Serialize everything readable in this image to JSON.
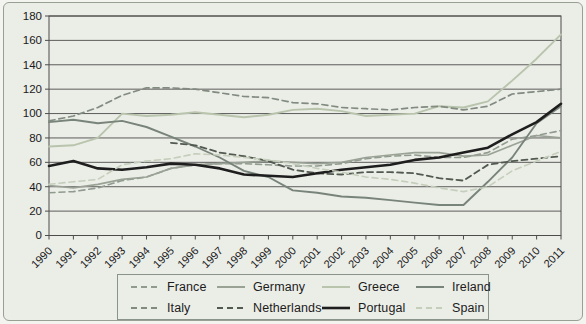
{
  "figure": {
    "background": "#ebede7",
    "outer_border_color": "#98a094",
    "grid_color": "#4d4d4d",
    "axis_color": "#4d4d4d",
    "tick_label_color": "#1a1a1a"
  },
  "chart_data": {
    "type": "line",
    "title": "",
    "xlabel": "",
    "ylabel": "",
    "x": [
      1990,
      1991,
      1992,
      1993,
      1994,
      1995,
      1996,
      1997,
      1998,
      1999,
      2000,
      2001,
      2002,
      2003,
      2004,
      2005,
      2006,
      2007,
      2008,
      2009,
      2010,
      2011
    ],
    "ylim": [
      0,
      180
    ],
    "ytick_step": 20,
    "grid": "horizontal",
    "legend_position": "bottom",
    "series": [
      {
        "name": "France",
        "color": "#909a8e",
        "style": "dashed",
        "width": 1.6,
        "values": [
          35,
          36,
          39,
          45,
          48,
          55,
          58,
          59,
          59,
          58,
          57,
          57,
          59,
          63,
          65,
          66,
          64,
          64,
          68,
          79,
          82,
          86
        ]
      },
      {
        "name": "Germany",
        "color": "#9aa296",
        "style": "solid",
        "width": 1.7,
        "values": [
          41,
          39,
          42,
          46,
          48,
          55,
          58,
          59,
          60,
          61,
          60,
          59,
          60,
          64,
          66,
          68,
          68,
          65,
          66,
          74,
          82,
          80
        ]
      },
      {
        "name": "Greece",
        "color": "#b9c4ad",
        "style": "solid",
        "width": 1.9,
        "values": [
          73,
          74,
          80,
          100,
          98,
          99,
          101,
          99,
          97,
          99,
          103,
          104,
          102,
          98,
          99,
          100,
          106,
          105,
          110,
          127,
          145,
          165
        ]
      },
      {
        "name": "Ireland",
        "color": "#78847a",
        "style": "solid",
        "width": 1.9,
        "values": [
          93,
          95,
          92,
          94,
          89,
          81,
          73,
          64,
          53,
          48,
          37,
          35,
          32,
          31,
          29,
          27,
          25,
          25,
          44,
          64,
          92,
          106
        ]
      },
      {
        "name": "Italy",
        "color": "#828b80",
        "style": "dashed",
        "width": 1.7,
        "values": [
          94,
          98,
          105,
          115,
          121,
          121,
          120,
          117,
          114,
          113,
          109,
          108,
          105,
          104,
          103,
          105,
          106,
          103,
          106,
          116,
          118,
          120
        ]
      },
      {
        "name": "Netherlands",
        "color": "#525a50",
        "style": "dashed",
        "width": 1.8,
        "values": [
          null,
          null,
          null,
          null,
          null,
          76,
          74,
          68,
          65,
          61,
          54,
          51,
          50,
          52,
          52,
          51,
          47,
          45,
          58,
          61,
          63,
          65
        ]
      },
      {
        "name": "Portugal",
        "color": "#1e1e1e",
        "style": "solid",
        "width": 2.6,
        "values": [
          57,
          61,
          55,
          54,
          56,
          59,
          58,
          55,
          50,
          49,
          48,
          51,
          54,
          56,
          58,
          62,
          64,
          68,
          72,
          83,
          93,
          108
        ]
      },
      {
        "name": "Spain",
        "color": "#c5cebb",
        "style": "dashed",
        "width": 1.6,
        "values": [
          42,
          44,
          46,
          58,
          61,
          63,
          67,
          66,
          64,
          62,
          59,
          55,
          52,
          48,
          46,
          43,
          39,
          36,
          40,
          53,
          61,
          69
        ]
      }
    ]
  }
}
